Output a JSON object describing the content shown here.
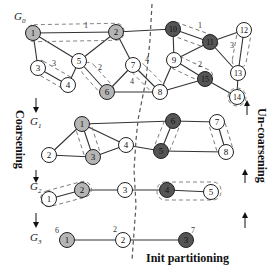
{
  "colors": {
    "light_partition": "#b5b5b5",
    "dark_partition": "#555555",
    "unassigned": "#ffffff",
    "edge": "#333333"
  },
  "labels": {
    "coarsening": "Coarsening",
    "uncoarsening": "Un-coarsening",
    "init_partitioning": "Init partitioning"
  },
  "levels": [
    {
      "name": "G0",
      "sub": "0",
      "nodes": [
        {
          "id": "1",
          "x": 33,
          "y": 33,
          "fill": "light"
        },
        {
          "id": "2",
          "x": 116,
          "y": 32,
          "fill": "light"
        },
        {
          "id": "3",
          "x": 38,
          "y": 68,
          "fill": "white"
        },
        {
          "id": "4",
          "x": 68,
          "y": 85,
          "fill": "white"
        },
        {
          "id": "5",
          "x": 79,
          "y": 61,
          "fill": "white"
        },
        {
          "id": "6",
          "x": 107,
          "y": 92,
          "fill": "light"
        },
        {
          "id": "7",
          "x": 133,
          "y": 65,
          "fill": "white"
        },
        {
          "id": "8",
          "x": 160,
          "y": 92,
          "fill": "white"
        },
        {
          "id": "9",
          "x": 174,
          "y": 60,
          "fill": "white"
        },
        {
          "id": "10",
          "x": 173,
          "y": 29,
          "fill": "dark"
        },
        {
          "id": "11",
          "x": 210,
          "y": 42,
          "fill": "dark"
        },
        {
          "id": "12",
          "x": 244,
          "y": 30,
          "fill": "white"
        },
        {
          "id": "13",
          "x": 238,
          "y": 73,
          "fill": "white"
        },
        {
          "id": "14",
          "x": 237,
          "y": 97,
          "fill": "white"
        },
        {
          "id": "15",
          "x": 205,
          "y": 79,
          "fill": "dark"
        }
      ],
      "weights": [
        {
          "text": "1",
          "x": 84,
          "y": 28
        },
        {
          "text": "3",
          "x": 52,
          "y": 66
        },
        {
          "text": "2",
          "x": 98,
          "y": 70
        },
        {
          "text": "4",
          "x": 147,
          "y": 62
        },
        {
          "text": "4",
          "x": 132,
          "y": 82
        },
        {
          "text": "1",
          "x": 198,
          "y": 28
        },
        {
          "text": "3",
          "x": 231,
          "y": 47
        },
        {
          "text": "2",
          "x": 199,
          "y": 66
        }
      ]
    },
    {
      "name": "G1",
      "sub": "1",
      "nodes": [
        {
          "id": "1",
          "x": 82,
          "y": 124,
          "fill": "light"
        },
        {
          "id": "2",
          "x": 49,
          "y": 155,
          "fill": "white"
        },
        {
          "id": "3",
          "x": 93,
          "y": 157,
          "fill": "light"
        },
        {
          "id": "4",
          "x": 126,
          "y": 145,
          "fill": "white"
        },
        {
          "id": "5",
          "x": 161,
          "y": 151,
          "fill": "dark"
        },
        {
          "id": "6",
          "x": 173,
          "y": 121,
          "fill": "dark"
        },
        {
          "id": "7",
          "x": 217,
          "y": 122,
          "fill": "white"
        },
        {
          "id": "8",
          "x": 226,
          "y": 152,
          "fill": "white"
        }
      ]
    },
    {
      "name": "G2",
      "sub": "2",
      "nodes": [
        {
          "id": "1",
          "x": 49,
          "y": 199,
          "fill": "white"
        },
        {
          "id": "2",
          "x": 82,
          "y": 190,
          "fill": "light"
        },
        {
          "id": "3",
          "x": 125,
          "y": 190,
          "fill": "white"
        },
        {
          "id": "4",
          "x": 167,
          "y": 190,
          "fill": "dark"
        },
        {
          "id": "5",
          "x": 211,
          "y": 192,
          "fill": "white"
        }
      ]
    },
    {
      "name": "G3",
      "sub": "3",
      "nodes": [
        {
          "id": "1",
          "x": 67,
          "y": 240,
          "fill": "light",
          "weight": "6"
        },
        {
          "id": "2",
          "x": 123,
          "y": 240,
          "fill": "white",
          "weight": "2"
        },
        {
          "id": "3",
          "x": 186,
          "y": 240,
          "fill": "dark",
          "weight": "7"
        }
      ]
    }
  ]
}
